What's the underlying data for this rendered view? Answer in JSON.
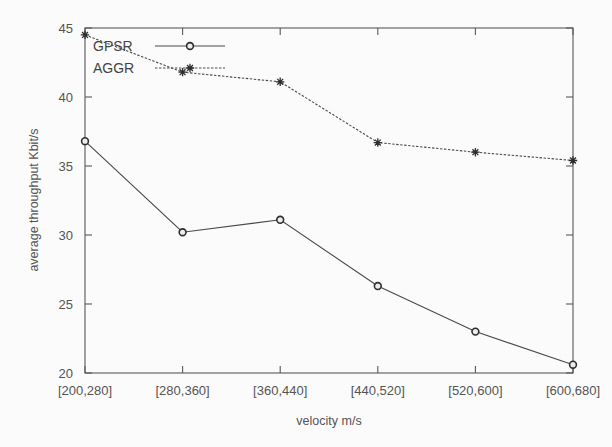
{
  "chart_data": {
    "type": "line",
    "title": "",
    "subtitle": "",
    "xlabel": "velocity m/s",
    "ylabel": "average throughput Kbit/s",
    "categories": [
      "[200,280]",
      "[280,360]",
      "[360,440]",
      "[440,520]",
      "[520,600]",
      "[600,680]"
    ],
    "ylim": [
      20,
      45
    ],
    "yticks": [
      "20",
      "25",
      "30",
      "35",
      "40",
      "45"
    ],
    "ytick_values": [
      20,
      25,
      30,
      35,
      40,
      45
    ],
    "grid": false,
    "legend_position": "top-left inside plot",
    "series": [
      {
        "name": "GPSR",
        "marker": "circle",
        "linestyle": "solid",
        "values": [
          36.8,
          30.2,
          31.1,
          26.3,
          23.0,
          20.6
        ]
      },
      {
        "name": "AGGR",
        "marker": "star",
        "linestyle": "dashed",
        "values": [
          44.5,
          41.8,
          41.1,
          36.7,
          36.0,
          35.4
        ]
      }
    ]
  },
  "axes": {
    "y_axis_title": "average throughput Kbit/s",
    "x_axis_title": "velocity m/s"
  },
  "legend": {
    "entries": [
      {
        "label": "GPSR",
        "marker": "circle-marker",
        "line": "solid-line"
      },
      {
        "label": "AGGR",
        "marker": "star-marker",
        "line": "dashed-line"
      }
    ]
  },
  "colors": {
    "background": "#fdfdfd",
    "ink": "#4a4a4a",
    "text": "#555555",
    "marker_outline": "#2e2e2e"
  }
}
